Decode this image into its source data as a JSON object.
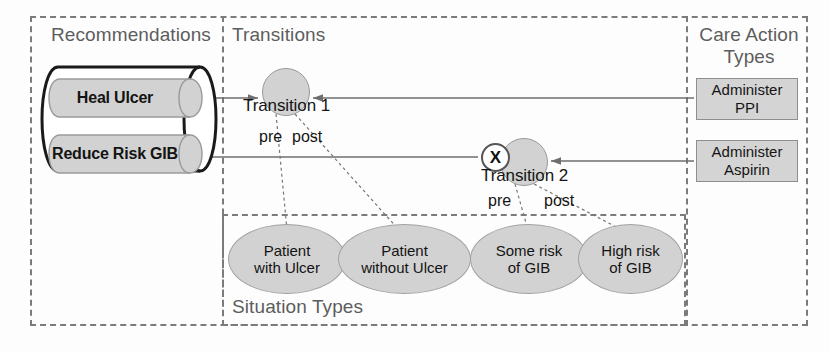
{
  "regions": {
    "recommendations": {
      "label": "Recommendations"
    },
    "transitions": {
      "label": "Transitions"
    },
    "care_action_types": {
      "label": "Care Action\nTypes"
    },
    "situation_types": {
      "label": "Situation Types"
    }
  },
  "recommendations": {
    "items": [
      {
        "label": "Heal Ulcer"
      },
      {
        "label": "Reduce Risk GIB"
      }
    ]
  },
  "transitions": [
    {
      "label": "Transition 1",
      "pre_label": "pre",
      "post_label": "post",
      "blocked": false
    },
    {
      "label": "Transition 2",
      "pre_label": "pre",
      "post_label": "post",
      "blocked": true,
      "blocked_marker": "X"
    }
  ],
  "situation_types": [
    {
      "label": "Patient\nwith Ulcer"
    },
    {
      "label": "Patient\nwithout Ulcer"
    },
    {
      "label": "Some risk\nof GIB"
    },
    {
      "label": "High risk\nof GIB"
    }
  ],
  "care_action_types": [
    {
      "label": "Administer\nPPI"
    },
    {
      "label": "Administer\nAspirin"
    }
  ],
  "colors": {
    "node_fill": "#d2d2d2",
    "node_stroke": "#9a9a9a",
    "box_fill": "#d4d4d4",
    "region_border": "#7b7b7b",
    "text": "#141414",
    "region_label_text": "#5d5d5d",
    "marker_fill": "#ffffff",
    "marker_stroke": "#555555"
  }
}
